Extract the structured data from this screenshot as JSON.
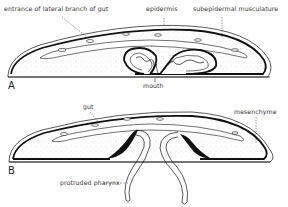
{
  "figure": {
    "panels": [
      {
        "id": "A",
        "letter": "A",
        "labels": {
          "lateral_branch": "entrance of lateral branch of gut",
          "epidermis": "epidermis",
          "musculature": "subepidermal musculature",
          "mouth": "mouth"
        }
      },
      {
        "id": "B",
        "letter": "B",
        "labels": {
          "gut": "gut",
          "mesenchyme": "mesenchyme",
          "pharynx": "protruded pharynx"
        }
      }
    ],
    "colors": {
      "ink": "#111111",
      "label": "#333333",
      "stipple": "#9a9a9a",
      "background": "#ffffff"
    }
  }
}
